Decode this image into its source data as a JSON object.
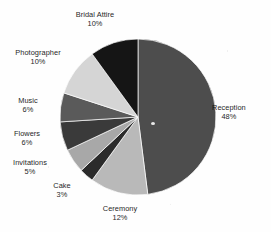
{
  "chart_data": {
    "type": "pie",
    "title": "",
    "subtitle": "",
    "xlabel": "",
    "ylabel": "",
    "legend_position": "none",
    "grid": false,
    "units": "percent",
    "total": 100,
    "start_angle_deg": 0,
    "direction": "clockwise",
    "categories": [
      "Reception",
      "Ceremony",
      "Cake",
      "Invitations",
      "Flowers",
      "Music",
      "Photographer",
      "Bridal Attire"
    ],
    "values": [
      48,
      12,
      3,
      5,
      6,
      6,
      10,
      10
    ],
    "slices": [
      {
        "label": "Reception",
        "value": 48,
        "pct_text": "48%",
        "color": "#4d4d4d",
        "label_x": 212,
        "label_y": 103,
        "align": "left"
      },
      {
        "label": "Ceremony",
        "value": 12,
        "pct_text": "12%",
        "color": "#b9b9b9",
        "label_x": 120,
        "label_y": 204,
        "align": "center"
      },
      {
        "label": "Cake",
        "value": 3,
        "pct_text": "3%",
        "color": "#2b2b2b",
        "label_x": 62,
        "label_y": 181,
        "align": "center"
      },
      {
        "label": "Invitations",
        "value": 5,
        "pct_text": "5%",
        "color": "#a8a8a8",
        "label_x": 30,
        "label_y": 158,
        "align": "center"
      },
      {
        "label": "Flowers",
        "value": 6,
        "pct_text": "6%",
        "color": "#3a3a3a",
        "label_x": 27,
        "label_y": 129,
        "align": "center"
      },
      {
        "label": "Music",
        "value": 6,
        "pct_text": "6%",
        "color": "#5a5a5a",
        "label_x": 28,
        "label_y": 96,
        "align": "center"
      },
      {
        "label": "Photographer",
        "value": 10,
        "pct_text": "10%",
        "color": "#d5d5d5",
        "label_x": 38,
        "label_y": 48,
        "align": "center"
      },
      {
        "label": "Bridal Attire",
        "value": 10,
        "pct_text": "10%",
        "color": "#151515",
        "label_x": 95,
        "label_y": 10,
        "align": "center"
      }
    ],
    "geometry": {
      "cx": 138,
      "cy": 117,
      "r": 78
    },
    "background_color": "#fefefe",
    "text_color": "#111111"
  }
}
